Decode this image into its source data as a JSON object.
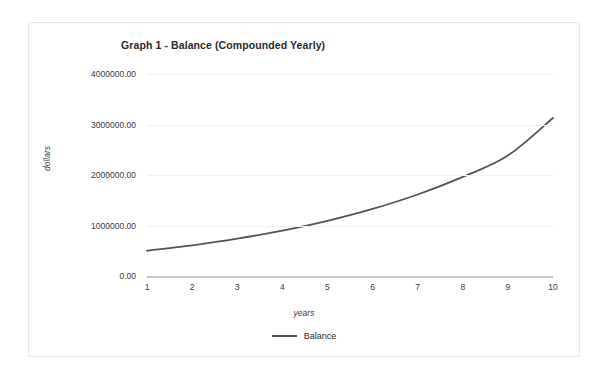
{
  "chart_data": {
    "type": "line",
    "title": "Graph 1 - Balance (Compounded Yearly)",
    "xlabel": "years",
    "ylabel": "dollars",
    "x": [
      1,
      2,
      3,
      4,
      5,
      6,
      7,
      8,
      9,
      10
    ],
    "xticklabels": [
      "1",
      "2",
      "3",
      "4",
      "5",
      "6",
      "7",
      "8",
      "9",
      "10"
    ],
    "yticks": [
      0,
      1000000,
      2000000,
      3000000,
      4000000
    ],
    "yticklabels": [
      "0.00",
      "1000000.00",
      "2000000.00",
      "3000000.00",
      "4000000.00"
    ],
    "xlim": [
      1,
      10
    ],
    "ylim": [
      0,
      4000000
    ],
    "grid": true,
    "legend_position": "bottom-center",
    "series": [
      {
        "name": "Balance",
        "color": "#555558",
        "values": [
          500000,
          608000,
          739000,
          898000,
          1092000,
          1328000,
          1614000,
          1962000,
          2386000,
          3130000
        ]
      }
    ]
  },
  "legend": {
    "items": [
      {
        "label": "Balance",
        "color": "#555558",
        "marker": "line-swatch"
      }
    ]
  },
  "colors": {
    "series_line": "#555558",
    "gridline": "#f0f0f2",
    "axis_line": "#c8c8cc",
    "card_border": "#e9e9e9",
    "text": "#2b2b2b",
    "background": "#ffffff"
  }
}
